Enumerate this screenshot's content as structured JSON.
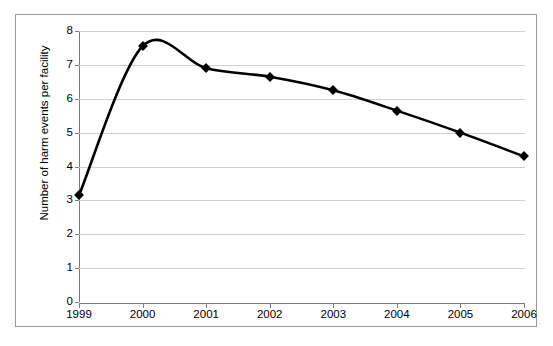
{
  "chart_data": {
    "type": "line",
    "title": "",
    "xlabel": "",
    "ylabel": "Number of harm events per facility",
    "categories": [
      "1999",
      "2000",
      "2001",
      "2002",
      "2003",
      "2004",
      "2005",
      "2006"
    ],
    "values": [
      3.15,
      7.55,
      6.9,
      6.65,
      6.25,
      5.65,
      5.0,
      4.3
    ],
    "series": [
      {
        "name": "Number of harm events per facility",
        "values": [
          3.15,
          7.55,
          6.9,
          6.65,
          6.25,
          5.65,
          5.0,
          4.3
        ]
      }
    ],
    "x_tick_labels": [
      "1999",
      "2000",
      "2001",
      "2002",
      "2003",
      "2004",
      "2005",
      "2006"
    ],
    "y_tick_labels": [
      "0",
      "1",
      "2",
      "3",
      "4",
      "5",
      "6",
      "7",
      "8"
    ],
    "y_tick_values": [
      0,
      1,
      2,
      3,
      4,
      5,
      6,
      7,
      8
    ],
    "ylim": [
      0,
      8
    ],
    "xlim": [
      "1999",
      "2006"
    ],
    "grid": "horizontal",
    "legend": "none",
    "line_color": "#000000",
    "grid_color": "#d0d0d0",
    "axis_color": "#7a7a7a",
    "marker_style": "diamond",
    "marker_color": "#000000",
    "smoothing": "smoothed-spline",
    "border_color": "#9a9a9a",
    "background_color": "#ffffff"
  }
}
